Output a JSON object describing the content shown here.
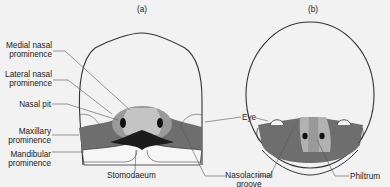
{
  "figure": {
    "panel_a": {
      "title": "(a)",
      "labels": {
        "medial_nasal_1": "Medial nasal",
        "medial_nasal_2": "prominence",
        "lateral_nasal_1": "Lateral nasal",
        "lateral_nasal_2": "prominence",
        "nasal_pit": "Nasal pit",
        "maxillary_1": "Maxillary",
        "maxillary_2": "prominence",
        "mandibular_1": "Mandibular",
        "mandibular_2": "prominence",
        "stomodaeum": "Stomodaeum"
      }
    },
    "shared_labels": {
      "eye": "Eye",
      "nasolacrimal_1": "Nasolacrimal",
      "nasolacrimal_2": "groove"
    },
    "panel_b": {
      "title": "(b)",
      "labels": {
        "philtrum": "Philtrum"
      }
    },
    "colors": {
      "background": "#f2f2f2",
      "outline": "#333333",
      "maxillary_dark": "#6e6e6e",
      "lateral_nasal_mid": "#9a9a9a",
      "medial_nasal_light": "#c4c4c4",
      "pit_black": "#111111"
    }
  }
}
